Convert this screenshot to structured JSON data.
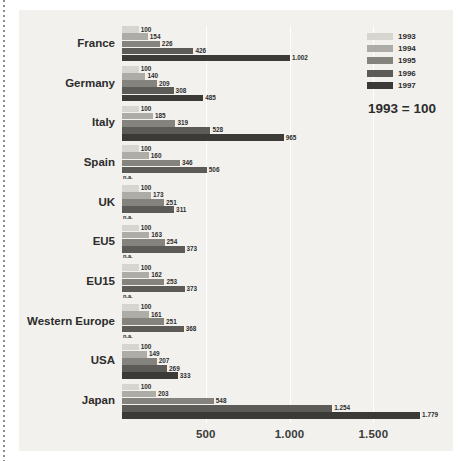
{
  "chart_data": {
    "type": "bar",
    "orientation": "horizontal",
    "title": "",
    "subtitle": "",
    "note": "1993 = 100",
    "xlabel": "",
    "ylabel": "",
    "xlim": [
      0,
      1850
    ],
    "xticks": [
      500,
      1000,
      1500
    ],
    "xtick_labels": [
      "500",
      "1.000",
      "1.500"
    ],
    "grid": "vertical",
    "legend_position": "top-right",
    "categories": [
      "France",
      "Germany",
      "Italy",
      "Spain",
      "UK",
      "EU5",
      "EU15",
      "Western Europe",
      "USA",
      "Japan"
    ],
    "series": [
      {
        "name": "1993",
        "color": "#d7d5d0",
        "values": [
          100,
          100,
          100,
          100,
          100,
          100,
          100,
          100,
          100,
          100
        ],
        "labels": [
          "100",
          "100",
          "100",
          "100",
          "100",
          "100",
          "100",
          "100",
          "100",
          "100"
        ]
      },
      {
        "name": "1994",
        "color": "#aeaca6",
        "values": [
          154,
          140,
          185,
          160,
          173,
          163,
          162,
          161,
          149,
          203
        ],
        "labels": [
          "154",
          "140",
          "185",
          "160",
          "173",
          "163",
          "162",
          "161",
          "149",
          "203"
        ]
      },
      {
        "name": "1995",
        "color": "#85837d",
        "values": [
          226,
          209,
          319,
          346,
          251,
          254,
          253,
          251,
          207,
          548
        ],
        "labels": [
          "226",
          "209",
          "319",
          "346",
          "251",
          "254",
          "253",
          "251",
          "207",
          "548"
        ]
      },
      {
        "name": "1996",
        "color": "#5d5b57",
        "values": [
          426,
          308,
          528,
          506,
          311,
          373,
          373,
          368,
          269,
          1254
        ],
        "labels": [
          "426",
          "308",
          "528",
          "506",
          "311",
          "373",
          "373",
          "368",
          "269",
          "1.254"
        ]
      },
      {
        "name": "1997",
        "color": "#3c3a37",
        "values": [
          1002,
          485,
          965,
          null,
          null,
          null,
          null,
          null,
          333,
          1779
        ],
        "labels": [
          "1.002",
          "485",
          "965",
          "n.a.",
          "n.a.",
          "n.a.",
          "n.a.",
          "n.a.",
          "333",
          "1.779"
        ]
      }
    ]
  },
  "legend": {
    "items": [
      {
        "label": "1993",
        "color": "#d7d5d0"
      },
      {
        "label": "1994",
        "color": "#aeaca6"
      },
      {
        "label": "1995",
        "color": "#85837d"
      },
      {
        "label": "1996",
        "color": "#5d5b57"
      },
      {
        "label": "1997",
        "color": "#3c3a37"
      }
    ],
    "note": "1993 = 100"
  }
}
